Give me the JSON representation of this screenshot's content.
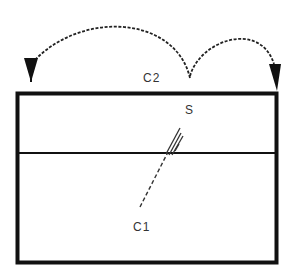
{
  "diagram": {
    "labels": {
      "c2": "C2",
      "s": "S",
      "c1": "C1"
    },
    "colors": {
      "stroke": "#111111",
      "text": "#333333",
      "background": "#ffffff"
    },
    "elements": [
      {
        "id": "outer-box",
        "type": "rectangle",
        "x": 16,
        "y": 92,
        "width": 262,
        "height": 172
      },
      {
        "id": "divider",
        "type": "line",
        "from": [
          16,
          153
        ],
        "to": [
          278,
          153
        ]
      },
      {
        "id": "crack",
        "type": "dashed-line",
        "from": [
          140,
          207
        ],
        "to": [
          180,
          128
        ]
      },
      {
        "id": "arc-left",
        "type": "dotted-arrow",
        "from": [
          190,
          78
        ],
        "to": [
          30,
          80
        ]
      },
      {
        "id": "arc-right",
        "type": "dotted-arrow",
        "from": [
          190,
          78
        ],
        "to": [
          276,
          88
        ]
      }
    ]
  }
}
